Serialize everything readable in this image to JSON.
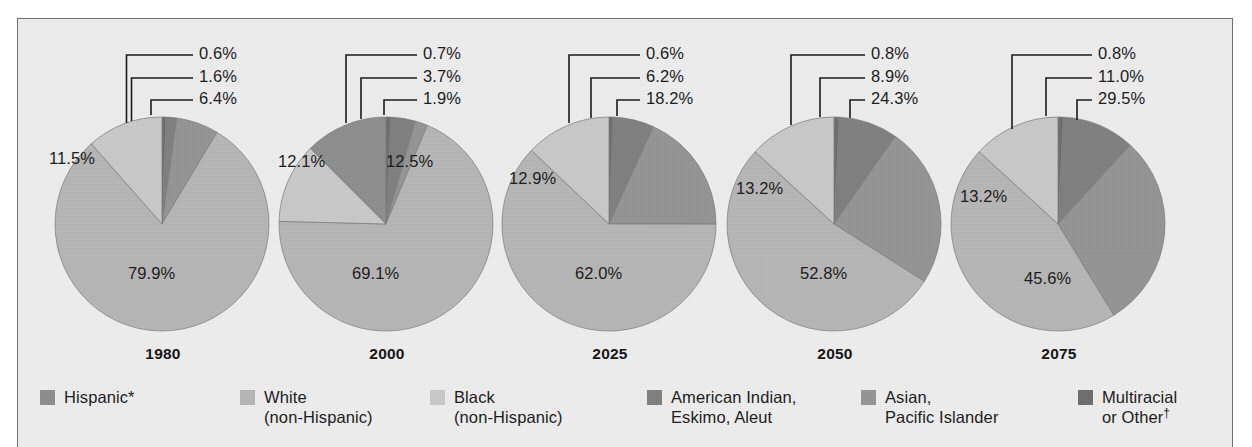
{
  "figure": {
    "panel_background": "#eeeeee",
    "border_color": "#6f6f6f"
  },
  "legend": {
    "items": [
      {
        "label_line1": "Hispanic*",
        "label_line2": "",
        "color": "#8e8e8e"
      },
      {
        "label_line1": "White",
        "label_line2": "(non-Hispanic)",
        "color": "#b6b6b6"
      },
      {
        "label_line1": "Black",
        "label_line2": "(non-Hispanic)",
        "color": "#c9c9c9"
      },
      {
        "label_line1": "American Indian,",
        "label_line2": "Eskimo, Aleut",
        "color": "#808080"
      },
      {
        "label_line1": "Asian,",
        "label_line2": "Pacific Islander",
        "color": "#959595"
      },
      {
        "label_line1": "Multiracial",
        "label_line2": "or Other",
        "color": "#6e6e6e",
        "dagger": "†"
      }
    ]
  },
  "chart_data": {
    "type": "pie",
    "title": "",
    "legend_position": "bottom",
    "series_labels": [
      "Hispanic*",
      "White (non-Hispanic)",
      "Black (non-Hispanic)",
      "American Indian, Eskimo, Aleut",
      "Asian, Pacific Islander",
      "Multiracial or Other†"
    ],
    "charts": [
      {
        "year": "1980",
        "categories": [
          "Multiracial or Other",
          "American Indian, Eskimo, Aleut",
          "Asian, Pacific Islander",
          "White (non-Hispanic)",
          "Black (non-Hispanic)",
          "Hispanic*"
        ],
        "values": [
          0.6,
          1.6,
          6.4,
          79.9,
          11.5,
          0.0
        ],
        "labels": [
          "0.6%",
          "1.6%",
          "6.4%",
          "79.9%",
          "11.5%",
          ""
        ],
        "callout_labels": [
          "0.6%",
          "1.6%",
          "6.4%"
        ],
        "inner_labels": [
          "11.5%",
          "79.9%"
        ]
      },
      {
        "year": "2000",
        "categories": [
          "Multiracial or Other",
          "American Indian, Eskimo, Aleut",
          "Asian, Pacific Islander",
          "White (non-Hispanic)",
          "Black (non-Hispanic)",
          "Hispanic*"
        ],
        "values": [
          0.7,
          3.7,
          1.9,
          69.1,
          12.1,
          12.5
        ],
        "labels": [
          "0.7%",
          "3.7%",
          "1.9%",
          "69.1%",
          "12.1%",
          "12.5%"
        ],
        "callout_labels": [
          "0.7%",
          "3.7%",
          "1.9%"
        ],
        "inner_labels": [
          "12.1%",
          "69.1%",
          "12.5%"
        ]
      },
      {
        "year": "2025",
        "categories": [
          "Multiracial or Other",
          "American Indian, Eskimo, Aleut",
          "Asian, Pacific Islander",
          "White (non-Hispanic)",
          "Black (non-Hispanic)",
          "Hispanic*"
        ],
        "values": [
          0.6,
          6.2,
          18.2,
          62.0,
          12.9,
          0.0
        ],
        "labels": [
          "0.6%",
          "6.2%",
          "18.2%",
          "62.0%",
          "12.9%",
          ""
        ],
        "callout_labels": [
          "0.6%",
          "6.2%",
          "18.2%"
        ],
        "inner_labels": [
          "12.9%",
          "62.0%"
        ]
      },
      {
        "year": "2050",
        "categories": [
          "Multiracial or Other",
          "American Indian, Eskimo, Aleut",
          "Asian, Pacific Islander",
          "White (non-Hispanic)",
          "Black (non-Hispanic)",
          "Hispanic*"
        ],
        "values": [
          0.8,
          8.9,
          24.3,
          52.8,
          13.2,
          0.0
        ],
        "labels": [
          "0.8%",
          "8.9%",
          "24.3%",
          "52.8%",
          "13.2%",
          ""
        ],
        "callout_labels": [
          "0.8%",
          "8.9%",
          "24.3%"
        ],
        "inner_labels": [
          "13.2%",
          "52.8%"
        ]
      },
      {
        "year": "2075",
        "categories": [
          "Multiracial or Other",
          "American Indian, Eskimo, Aleut",
          "Asian, Pacific Islander",
          "White (non-Hispanic)",
          "Black (non-Hispanic)",
          "Hispanic*"
        ],
        "values": [
          0.8,
          11.0,
          29.5,
          45.6,
          13.2,
          0.0
        ],
        "labels": [
          "0.8%",
          "11.0%",
          "29.5%",
          "45.6%",
          "13.2%",
          ""
        ],
        "callout_labels": [
          "0.8%",
          "11.0%",
          "29.5%"
        ],
        "inner_labels": [
          "13.2%",
          "45.6%"
        ]
      }
    ]
  }
}
